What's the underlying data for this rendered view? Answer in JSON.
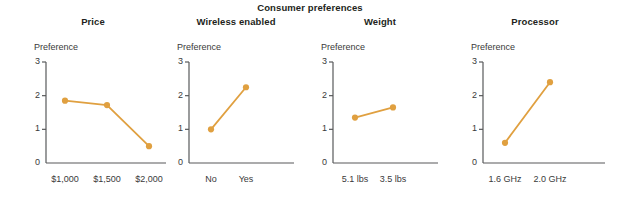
{
  "chart_data": {
    "type": "line",
    "title": "Consumer preferences",
    "ylabel": "Preference",
    "ylim": [
      0,
      3
    ],
    "yticks": [
      0,
      1,
      2,
      3
    ],
    "grid": false,
    "legend": false,
    "accent_color": "#e0a040",
    "axis_color": "#58595b",
    "panels": [
      {
        "title": "Price",
        "ylabel": "Preference",
        "categories": [
          "$1,000",
          "$1,500",
          "$2,000"
        ],
        "values": [
          1.85,
          1.72,
          0.5
        ]
      },
      {
        "title": "Wireless enabled",
        "ylabel": "Preference",
        "categories": [
          "No",
          "Yes"
        ],
        "values": [
          1.0,
          2.25
        ]
      },
      {
        "title": "Weight",
        "ylabel": "Preference",
        "categories": [
          "5.1 lbs",
          "3.5 lbs"
        ],
        "values": [
          1.35,
          1.65
        ]
      },
      {
        "title": "Processor",
        "ylabel": "Preference",
        "categories": [
          "1.6 GHz",
          "2.0 GHz"
        ],
        "values": [
          0.6,
          2.4
        ]
      }
    ]
  }
}
